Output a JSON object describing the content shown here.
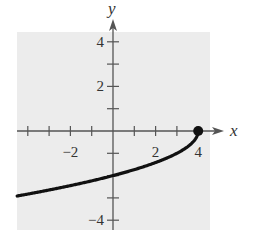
{
  "chart_data": {
    "type": "line",
    "title": "",
    "xlabel": "x",
    "ylabel": "y",
    "xlim": [
      -4.5,
      4.5
    ],
    "ylim": [
      -4.4,
      4.5
    ],
    "grid": false,
    "background": "#ececec",
    "x_ticks": [
      -4,
      -3,
      -2,
      -1,
      1,
      2,
      3,
      4
    ],
    "y_ticks": [
      -4,
      -3,
      -2,
      -1,
      1,
      2,
      3,
      4
    ],
    "x_tick_labels": [
      {
        "value": -2,
        "label": "−2"
      },
      {
        "value": 2,
        "label": "2"
      },
      {
        "value": 4,
        "label": "4"
      }
    ],
    "y_tick_labels": [
      {
        "value": 4,
        "label": "4"
      },
      {
        "value": 2,
        "label": "2"
      },
      {
        "value": -4,
        "label": "−4"
      }
    ],
    "series": [
      {
        "name": "y = -sqrt(4 - x)",
        "color": "#111111",
        "x": [
          -4.5,
          -4,
          -3,
          -2,
          -1,
          0,
          1,
          2,
          3,
          3.5,
          3.9,
          4
        ],
        "y": [
          -2.92,
          -2.83,
          -2.65,
          -2.45,
          -2.24,
          -2.0,
          -1.73,
          -1.41,
          -1.0,
          -0.71,
          -0.32,
          0.0
        ]
      }
    ],
    "annotations": [
      {
        "type": "closed-dot",
        "x": 4,
        "y": 0
      }
    ]
  }
}
